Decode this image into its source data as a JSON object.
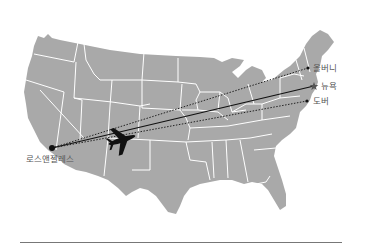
{
  "map": {
    "region": "United States",
    "land_color": "#a9a9a9",
    "border_color": "#ffffff",
    "origin": {
      "name": "로스앤젤레스",
      "x": 52,
      "y": 148
    },
    "destinations": [
      {
        "name": "올버니",
        "x": 308,
        "y": 68,
        "route_style": "dotted"
      },
      {
        "name": "뉴욕",
        "x": 314,
        "y": 86,
        "route_style": "solid"
      },
      {
        "name": "도버",
        "x": 307,
        "y": 101,
        "route_style": "dotted"
      }
    ],
    "airplane_icon": "airplane-icon"
  },
  "labels": {
    "origin": "로스앤젤레스",
    "albany": "올버니",
    "newyork": "뉴욕",
    "dover": "도버"
  }
}
